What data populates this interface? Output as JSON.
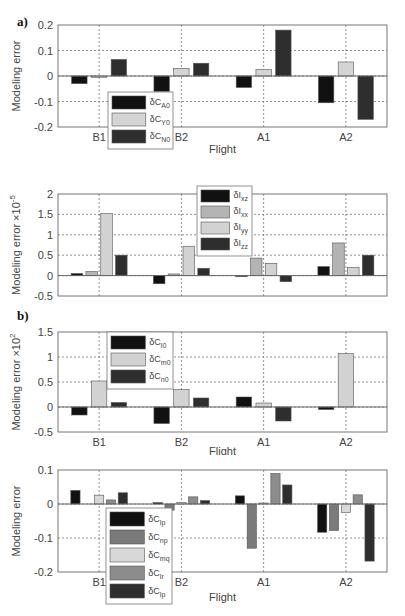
{
  "figure": {
    "panel_labels": [
      "a)",
      "b)"
    ]
  },
  "chart_data": [
    {
      "type": "bar",
      "id": "a-top",
      "panel": "a)",
      "categories": [
        "B1",
        "B2",
        "A1",
        "A2"
      ],
      "xlabel": "Flight",
      "ylabel": "Modeling error",
      "ylabel_exp": "",
      "ylim": [
        -0.2,
        0.2
      ],
      "yticks": [
        -0.2,
        -0.1,
        0,
        0.1,
        0.2
      ],
      "ytick_labels": [
        "-0.2",
        "-0.1",
        "0",
        "0.1",
        "0.2"
      ],
      "grid": true,
      "legend_position": "lower-left",
      "series": [
        {
          "name": "δC",
          "sub": "A0",
          "color": "#111111",
          "values": [
            -0.03,
            -0.06,
            -0.045,
            -0.105
          ]
        },
        {
          "name": "δC",
          "sub": "Y0",
          "color": "#d4d4d4",
          "values": [
            -0.005,
            0.03,
            0.025,
            0.055
          ]
        },
        {
          "name": "δC",
          "sub": "N0",
          "color": "#2e2e2e",
          "values": [
            0.065,
            0.05,
            0.18,
            -0.17
          ]
        }
      ]
    },
    {
      "type": "bar",
      "id": "a-bottom",
      "panel": "a)",
      "categories": [
        "B1",
        "B2",
        "A1",
        "A2"
      ],
      "xlabel": "Flight",
      "ylabel": "Modeling error ×10",
      "ylabel_exp": "-5",
      "ylim": [
        -0.5,
        2
      ],
      "yticks": [
        -0.5,
        0,
        0.5,
        1,
        1.5,
        2
      ],
      "ytick_labels": [
        "-0.5",
        "0",
        "0.5",
        "1",
        "1.5",
        "2"
      ],
      "grid": true,
      "legend_position": "upper-center",
      "series": [
        {
          "name": "δI",
          "sub": "xz",
          "color": "#111111",
          "values": [
            0.05,
            -0.2,
            -0.02,
            0.22
          ]
        },
        {
          "name": "δI",
          "sub": "xx",
          "color": "#b4b4b4",
          "values": [
            0.1,
            0.04,
            0.43,
            0.8
          ]
        },
        {
          "name": "δI",
          "sub": "yy",
          "color": "#d2d2d2",
          "values": [
            1.52,
            0.72,
            0.3,
            0.2
          ]
        },
        {
          "name": "δI",
          "sub": "zz",
          "color": "#2e2e2e",
          "values": [
            0.5,
            0.18,
            -0.15,
            0.5
          ]
        }
      ]
    },
    {
      "type": "bar",
      "id": "b-top",
      "panel": "b)",
      "categories": [
        "B1",
        "B2",
        "A1",
        "A2"
      ],
      "xlabel": "Flight",
      "ylabel": "Modeling error ×10",
      "ylabel_exp": "2",
      "ylim": [
        -0.5,
        1.5
      ],
      "yticks": [
        -0.5,
        0,
        0.5,
        1,
        1.5
      ],
      "ytick_labels": [
        "-0.5",
        "0",
        "0.5",
        "1",
        "1.5"
      ],
      "grid": true,
      "legend_position": "upper-left",
      "series": [
        {
          "name": "δC",
          "sub": "l0",
          "color": "#111111",
          "values": [
            -0.16,
            -0.33,
            0.2,
            -0.05
          ]
        },
        {
          "name": "δC",
          "sub": "m0",
          "color": "#d2d2d2",
          "values": [
            0.52,
            0.35,
            0.08,
            1.07
          ]
        },
        {
          "name": "δC",
          "sub": "n0",
          "color": "#2e2e2e",
          "values": [
            0.09,
            0.18,
            -0.28,
            0
          ]
        }
      ]
    },
    {
      "type": "bar",
      "id": "b-bottom",
      "panel": "b)",
      "categories": [
        "B1",
        "B2",
        "A1",
        "A2"
      ],
      "xlabel": "Flight",
      "ylabel": "Modeling error",
      "ylabel_exp": "",
      "ylim": [
        -0.2,
        0.1
      ],
      "yticks": [
        -0.2,
        -0.1,
        0,
        0.1
      ],
      "ytick_labels": [
        "-0.2",
        "-0.1",
        "0",
        "0.1"
      ],
      "grid": true,
      "legend_position": "lower-left",
      "series": [
        {
          "name": "δC",
          "sub": "lp",
          "color": "#111111",
          "values": [
            0.04,
            0.004,
            0.024,
            -0.083
          ]
        },
        {
          "name": "δC",
          "sub": "np",
          "color": "#7a7a7a",
          "values": [
            0,
            -0.018,
            -0.13,
            -0.078
          ]
        },
        {
          "name": "δC",
          "sub": "mq",
          "color": "#d8d8d8",
          "values": [
            0.026,
            0.005,
            0.003,
            -0.025
          ]
        },
        {
          "name": "δC",
          "sub": "lr",
          "color": "#8c8c8c",
          "values": [
            0.012,
            0.021,
            0.09,
            0.027
          ]
        },
        {
          "name": "δC",
          "sub": "lp",
          "color": "#2e2e2e",
          "values": [
            0.033,
            0.01,
            0.056,
            -0.168
          ]
        }
      ]
    }
  ]
}
